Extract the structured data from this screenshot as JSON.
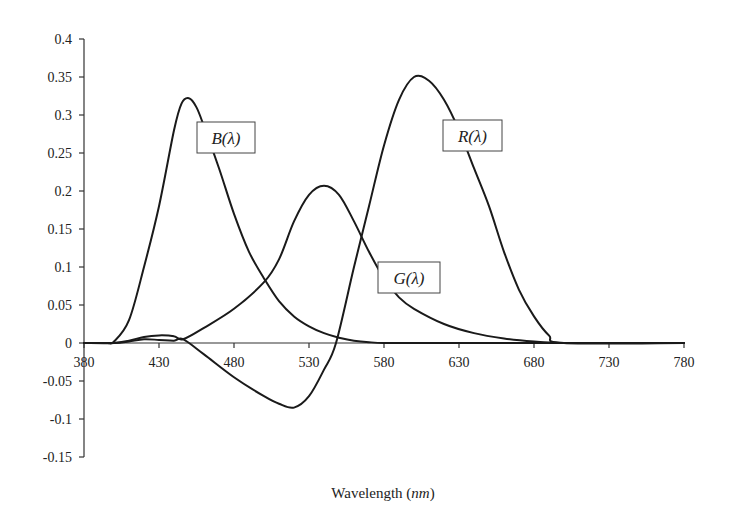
{
  "chart_data": {
    "type": "line",
    "title": "",
    "xlabel": "Wavelength",
    "xlabel_unit": "nm",
    "ylabel": "",
    "xlim": [
      380,
      780
    ],
    "ylim": [
      -0.15,
      0.4
    ],
    "x_ticks": [
      380,
      430,
      480,
      530,
      580,
      630,
      680,
      730,
      780
    ],
    "y_ticks": [
      0.4,
      0.35,
      0.3,
      0.25,
      0.2,
      0.15,
      0.1,
      0.05,
      0,
      -0.05,
      -0.1,
      -0.15
    ],
    "y_tick_labels": [
      "0.4",
      "0.35",
      "0.3",
      "0.25",
      "0.2",
      "0.15",
      "0.1",
      "0.05",
      "0",
      "-0.05",
      "-0.1",
      "-0.15"
    ],
    "grid": false,
    "legend": "inline labels",
    "series": [
      {
        "name": "B(λ)",
        "label_position": [
          465,
          0.3
        ],
        "x": [
          380,
          395,
          400,
          410,
          420,
          430,
          440,
          445,
          450,
          455,
          460,
          470,
          480,
          490,
          500,
          510,
          520,
          530,
          540,
          550,
          560,
          570,
          580,
          600,
          780
        ],
        "values": [
          0,
          0,
          0.002,
          0.03,
          0.1,
          0.18,
          0.28,
          0.315,
          0.322,
          0.31,
          0.285,
          0.23,
          0.17,
          0.12,
          0.085,
          0.055,
          0.035,
          0.022,
          0.013,
          0.007,
          0.003,
          0.001,
          0,
          0,
          0
        ]
      },
      {
        "name": "G(λ)",
        "label_position": [
          583,
          0.05
        ],
        "x": [
          380,
          400,
          410,
          420,
          430,
          440,
          446,
          460,
          480,
          500,
          510,
          520,
          530,
          540,
          550,
          560,
          570,
          580,
          590,
          600,
          620,
          640,
          660,
          680,
          700,
          780
        ],
        "values": [
          0,
          0,
          0.003,
          0.008,
          0.01,
          0.009,
          0.005,
          0.02,
          0.045,
          0.08,
          0.11,
          0.16,
          0.195,
          0.207,
          0.195,
          0.16,
          0.12,
          0.085,
          0.06,
          0.045,
          0.025,
          0.013,
          0.006,
          0.002,
          0,
          0
        ]
      },
      {
        "name": "R(λ)",
        "label_position": [
          625,
          0.3
        ],
        "x": [
          380,
          400,
          410,
          420,
          430,
          440,
          446,
          460,
          480,
          500,
          510,
          520,
          530,
          540,
          548,
          560,
          570,
          580,
          590,
          600,
          610,
          620,
          630,
          640,
          650,
          660,
          670,
          680,
          690,
          700,
          780
        ],
        "values": [
          0,
          0,
          0.002,
          0.005,
          0.004,
          0.003,
          0.005,
          -0.015,
          -0.045,
          -0.07,
          -0.08,
          -0.085,
          -0.07,
          -0.035,
          0,
          0.1,
          0.18,
          0.26,
          0.32,
          0.35,
          0.345,
          0.32,
          0.28,
          0.23,
          0.18,
          0.12,
          0.07,
          0.035,
          0.01,
          0,
          0
        ]
      }
    ]
  },
  "axis": {
    "x_title_main": "Wavelength (",
    "x_title_unit": "nm",
    "x_title_close": ")"
  },
  "labels": {
    "b": "B(λ)",
    "g": "G(λ)",
    "r": "R(λ)"
  }
}
